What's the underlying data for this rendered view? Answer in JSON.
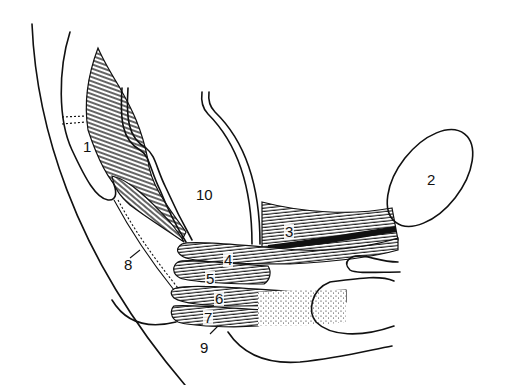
{
  "figure": {
    "type": "anatomical line drawing",
    "colors": {
      "ink": "#111111",
      "background": "#ffffff"
    },
    "labels": [
      {
        "id": "1",
        "text": "1",
        "x": 83,
        "y": 139
      },
      {
        "id": "2",
        "text": "2",
        "x": 427,
        "y": 172
      },
      {
        "id": "3",
        "text": "3",
        "x": 284,
        "y": 224
      },
      {
        "id": "4",
        "text": "4",
        "x": 223,
        "y": 252
      },
      {
        "id": "5",
        "text": "5",
        "x": 205,
        "y": 271
      },
      {
        "id": "6",
        "text": "6",
        "x": 214,
        "y": 291
      },
      {
        "id": "7",
        "text": "7",
        "x": 203,
        "y": 310
      },
      {
        "id": "8",
        "text": "8",
        "x": 124,
        "y": 257
      },
      {
        "id": "9",
        "text": "9",
        "x": 200,
        "y": 340
      },
      {
        "id": "10",
        "text": "10",
        "x": 196,
        "y": 187
      }
    ]
  }
}
